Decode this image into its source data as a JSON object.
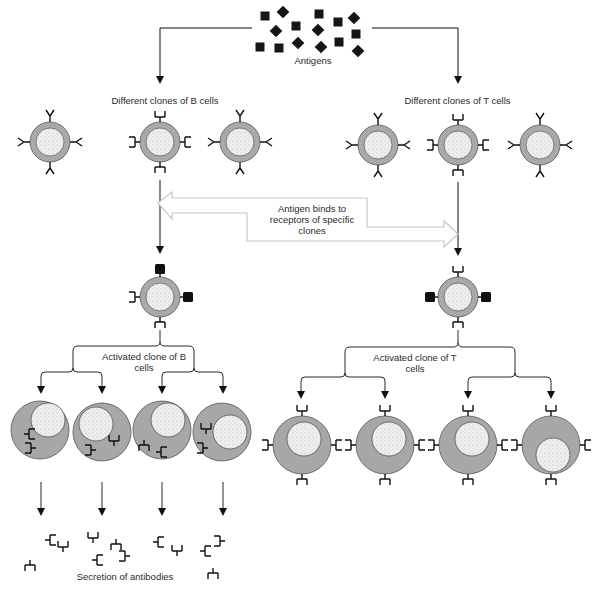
{
  "colors": {
    "ink": "#111111",
    "cell_ring": "#a9a9a9",
    "cell_ring_stroke": "#5a5a5a",
    "nucleus": "#ececec",
    "effector_body": "#a7a7a7",
    "hollow_arrow": "#c9c9c9"
  },
  "labels": {
    "antigens": "Antigens",
    "b_clones": "Different clones of B cells",
    "t_clones": "Different clones of T cells",
    "binding": "Antigen binds to receptors of specific clones",
    "activated_b": "Activated clone of B cells",
    "activated_t": "Activated clone of T cells",
    "secretion": "Secretion of antibodies"
  },
  "antigens": [
    {
      "x": 265,
      "y": 16,
      "shape": "square"
    },
    {
      "x": 283,
      "y": 12,
      "shape": "diamond"
    },
    {
      "x": 276,
      "y": 31,
      "shape": "diamond"
    },
    {
      "x": 296,
      "y": 26,
      "shape": "square"
    },
    {
      "x": 260,
      "y": 47,
      "shape": "square"
    },
    {
      "x": 279,
      "y": 48,
      "shape": "square"
    },
    {
      "x": 298,
      "y": 43,
      "shape": "diamond"
    },
    {
      "x": 319,
      "y": 14,
      "shape": "square"
    },
    {
      "x": 318,
      "y": 30,
      "shape": "diamond"
    },
    {
      "x": 338,
      "y": 22,
      "shape": "square"
    },
    {
      "x": 354,
      "y": 18,
      "shape": "diamond"
    },
    {
      "x": 356,
      "y": 34,
      "shape": "square"
    },
    {
      "x": 321,
      "y": 47,
      "shape": "diamond"
    },
    {
      "x": 339,
      "y": 42,
      "shape": "square"
    },
    {
      "x": 358,
      "y": 51,
      "shape": "diamond"
    }
  ],
  "resting_b_cells": [
    {
      "x": 50,
      "y": 142,
      "receptor": "Y"
    },
    {
      "x": 160,
      "y": 142,
      "receptor": "bracket"
    },
    {
      "x": 240,
      "y": 142,
      "receptor": "Y"
    }
  ],
  "resting_t_cells": [
    {
      "x": 378,
      "y": 145,
      "receptor": "Y"
    },
    {
      "x": 458,
      "y": 145,
      "receptor": "bracket"
    },
    {
      "x": 540,
      "y": 145,
      "receptor": "Y"
    }
  ],
  "activated_b": {
    "x": 160,
    "y": 297,
    "antigen_sides": [
      "top",
      "right"
    ]
  },
  "activated_t": {
    "x": 458,
    "y": 297,
    "antigen_sides": [
      "left",
      "right"
    ]
  },
  "plasma_cells": [
    {
      "x": 40,
      "y": 430,
      "nucleus_dx": 8,
      "nucleus_dy": -10
    },
    {
      "x": 102,
      "y": 432,
      "nucleus_dx": -6,
      "nucleus_dy": -8
    },
    {
      "x": 162,
      "y": 430,
      "nucleus_dx": 6,
      "nucleus_dy": -10
    },
    {
      "x": 222,
      "y": 432,
      "nucleus_dx": 8,
      "nucleus_dy": 0
    }
  ],
  "effector_t_cells": [
    {
      "x": 302,
      "y": 445,
      "nucleus_dx": 2,
      "nucleus_dy": -6
    },
    {
      "x": 385,
      "y": 445,
      "nucleus_dx": 4,
      "nucleus_dy": -6
    },
    {
      "x": 468,
      "y": 445,
      "nucleus_dx": 4,
      "nucleus_dy": -6
    },
    {
      "x": 551,
      "y": 445,
      "nucleus_dx": 2,
      "nucleus_dy": 10
    }
  ],
  "antibodies": [
    {
      "x": 45,
      "y": 540,
      "rot": 90
    },
    {
      "x": 63,
      "y": 552,
      "rot": 0
    },
    {
      "x": 30,
      "y": 560,
      "rot": 180
    },
    {
      "x": 93,
      "y": 543,
      "rot": 0
    },
    {
      "x": 116,
      "y": 539,
      "rot": 180
    },
    {
      "x": 92,
      "y": 560,
      "rot": 90
    },
    {
      "x": 130,
      "y": 556,
      "rot": -90
    },
    {
      "x": 153,
      "y": 542,
      "rot": 90
    },
    {
      "x": 177,
      "y": 556,
      "rot": 0
    },
    {
      "x": 200,
      "y": 551,
      "rot": 90
    },
    {
      "x": 225,
      "y": 541,
      "rot": -90
    },
    {
      "x": 213,
      "y": 568,
      "rot": 180
    }
  ]
}
